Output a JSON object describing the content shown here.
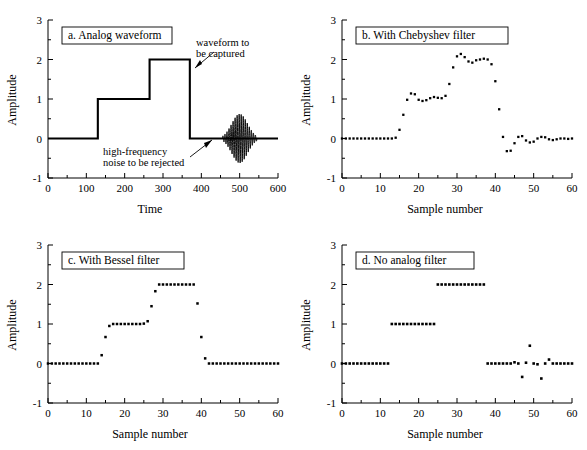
{
  "figure": {
    "panels": [
      {
        "id": "a",
        "title": "a.  Analog waveform",
        "xlabel": "Time",
        "ylabel": "Amplitude",
        "xticks": [
          0,
          100,
          200,
          300,
          400,
          500,
          600
        ],
        "yticks": [
          -1,
          0,
          1,
          2,
          3
        ],
        "xlim": [
          0,
          600
        ],
        "ylim": [
          -1,
          3
        ],
        "annotations": [
          {
            "name": "waveform-annotation",
            "line1": "waveform to",
            "line2": "be captured"
          },
          {
            "name": "noise-annotation",
            "line1": "high-frequency",
            "line2": "noise to be rejected"
          }
        ]
      },
      {
        "id": "b",
        "title": "b.  With Chebyshev filter",
        "xlabel": "Sample number",
        "ylabel": "Amplitude",
        "xticks": [
          0,
          10,
          20,
          30,
          40,
          50,
          60
        ],
        "yticks": [
          -1,
          0,
          1,
          2,
          3
        ],
        "xlim": [
          0,
          60
        ],
        "ylim": [
          -1,
          3
        ]
      },
      {
        "id": "c",
        "title": "c.  With Bessel filter",
        "xlabel": "Sample number",
        "ylabel": "Amplitude",
        "xticks": [
          0,
          10,
          20,
          30,
          40,
          50,
          60
        ],
        "yticks": [
          -1,
          0,
          1,
          2,
          3
        ],
        "xlim": [
          0,
          60
        ],
        "ylim": [
          -1,
          3
        ]
      },
      {
        "id": "d",
        "title": "d.  No analog filter",
        "xlabel": "Sample number",
        "ylabel": "Amplitude",
        "xticks": [
          0,
          10,
          20,
          30,
          40,
          50,
          60
        ],
        "yticks": [
          -1,
          0,
          1,
          2,
          3
        ],
        "xlim": [
          0,
          60
        ],
        "ylim": [
          -1,
          3
        ]
      }
    ]
  },
  "chart_data": [
    {
      "type": "line",
      "panel": "a",
      "title": "a.  Analog waveform",
      "xlabel": "Time",
      "ylabel": "Amplitude",
      "xlim": [
        0,
        600
      ],
      "ylim": [
        -1,
        3
      ],
      "grid": false,
      "legend": "none",
      "description": "Analog staircase waveform: 0 until t=130, 1 until t=265, 2 until t=370, then 0; plus a high-frequency Gaussian-enveloped noise burst centered near t=500.",
      "step_waveform": {
        "x": [
          0,
          130,
          130,
          265,
          265,
          370,
          370,
          600
        ],
        "y": [
          0,
          0,
          1,
          1,
          2,
          2,
          0,
          0
        ]
      },
      "noise_burst": {
        "center": 500,
        "half_width": 45,
        "peak_amplitude": 0.62,
        "cycles": 17
      }
    },
    {
      "type": "scatter",
      "panel": "b",
      "title": "b.  With Chebyshev filter",
      "xlabel": "Sample number",
      "ylabel": "Amplitude",
      "xlim": [
        0,
        60
      ],
      "ylim": [
        -1,
        3
      ],
      "grid": false,
      "legend": "none",
      "description": "Sampled staircase after a Chebyshev anti-alias filter: overshoot and ringing on each transition, noise burst rejected but leaving ringing tails.",
      "x": [
        0,
        1,
        2,
        3,
        4,
        5,
        6,
        7,
        8,
        9,
        10,
        11,
        12,
        13,
        14,
        15,
        16,
        17,
        18,
        19,
        20,
        21,
        22,
        23,
        24,
        25,
        26,
        27,
        28,
        29,
        30,
        31,
        32,
        33,
        34,
        35,
        36,
        37,
        38,
        39,
        40,
        41,
        42,
        43,
        44,
        45,
        46,
        47,
        48,
        49,
        50,
        51,
        52,
        53,
        54,
        55,
        56,
        57,
        58,
        59,
        60
      ],
      "y": [
        0,
        0,
        0,
        0,
        0,
        0,
        0,
        0,
        0,
        0,
        0,
        0,
        0,
        0,
        0.02,
        0.22,
        0.6,
        0.98,
        1.14,
        1.12,
        0.98,
        0.95,
        0.97,
        1.02,
        1.05,
        1.03,
        1.02,
        1.08,
        1.38,
        1.8,
        2.08,
        2.14,
        2.06,
        1.95,
        1.92,
        1.98,
        2.0,
        2.02,
        2.0,
        1.88,
        1.45,
        0.74,
        0.04,
        -0.32,
        -0.31,
        -0.12,
        0.04,
        0.06,
        -0.05,
        -0.1,
        -0.08,
        0.0,
        0.04,
        0.03,
        -0.02,
        -0.04,
        -0.02,
        0.0,
        0.0,
        -0.01,
        0.0
      ]
    },
    {
      "type": "scatter",
      "panel": "c",
      "title": "c.  With Bessel filter",
      "xlabel": "Sample number",
      "ylabel": "Amplitude",
      "xlim": [
        0,
        60
      ],
      "ylim": [
        -1,
        3
      ],
      "grid": false,
      "legend": "none",
      "description": "Sampled staircase after a Bessel anti-alias filter: smooth monotonic transitions with no overshoot, flat plateaus, noise burst fully rejected.",
      "x": [
        0,
        1,
        2,
        3,
        4,
        5,
        6,
        7,
        8,
        9,
        10,
        11,
        12,
        13,
        14,
        15,
        16,
        17,
        18,
        19,
        20,
        21,
        22,
        23,
        24,
        25,
        26,
        27,
        28,
        29,
        30,
        31,
        32,
        33,
        34,
        35,
        36,
        37,
        38,
        39,
        40,
        41,
        42,
        43,
        44,
        45,
        46,
        47,
        48,
        49,
        50,
        51,
        52,
        53,
        54,
        55,
        56,
        57,
        58,
        59,
        60
      ],
      "y": [
        0,
        0,
        0,
        0,
        0,
        0,
        0,
        0,
        0,
        0,
        0,
        0,
        0,
        0,
        0.21,
        0.67,
        0.95,
        1.0,
        1.0,
        1.0,
        1.0,
        1.0,
        1.0,
        1.0,
        1.0,
        1.01,
        1.07,
        1.45,
        1.83,
        2.0,
        2.0,
        2.0,
        2.0,
        2.0,
        2.0,
        2.0,
        2.0,
        2.0,
        2.0,
        1.52,
        0.67,
        0.13,
        0,
        0,
        0,
        0,
        0,
        0,
        0,
        0,
        0,
        0,
        0,
        0,
        0,
        0,
        0,
        0,
        0,
        0,
        0
      ]
    },
    {
      "type": "scatter",
      "panel": "d",
      "title": "d.  No analog filter",
      "xlabel": "Sample number",
      "ylabel": "Amplitude",
      "xlim": [
        0,
        60
      ],
      "ylim": [
        -1,
        3
      ],
      "grid": false,
      "legend": "none",
      "description": "Sampled staircase with no anti-alias filter: instantaneous step edges, but the high-frequency noise burst aliases into a low-frequency artifact near samples 45-54.",
      "x": [
        0,
        1,
        2,
        3,
        4,
        5,
        6,
        7,
        8,
        9,
        10,
        11,
        12,
        13,
        14,
        15,
        16,
        17,
        18,
        19,
        20,
        21,
        22,
        23,
        24,
        25,
        26,
        27,
        28,
        29,
        30,
        31,
        32,
        33,
        34,
        35,
        36,
        37,
        38,
        39,
        40,
        41,
        42,
        43,
        44,
        45,
        46,
        47,
        48,
        49,
        50,
        51,
        52,
        53,
        54,
        55,
        56,
        57,
        58,
        59,
        60
      ],
      "y": [
        0,
        0,
        0,
        0,
        0,
        0,
        0,
        0,
        0,
        0,
        0,
        0,
        0,
        1,
        1,
        1,
        1,
        1,
        1,
        1,
        1,
        1,
        1,
        1,
        1,
        2,
        2,
        2,
        2,
        2,
        2,
        2,
        2,
        2,
        2,
        2,
        2,
        2,
        0,
        0,
        0,
        0,
        0,
        0,
        0,
        0.03,
        0.0,
        -0.34,
        0.02,
        0.45,
        0.0,
        -0.02,
        -0.38,
        0.0,
        0.1,
        0,
        0,
        0,
        0,
        0,
        0
      ]
    }
  ]
}
